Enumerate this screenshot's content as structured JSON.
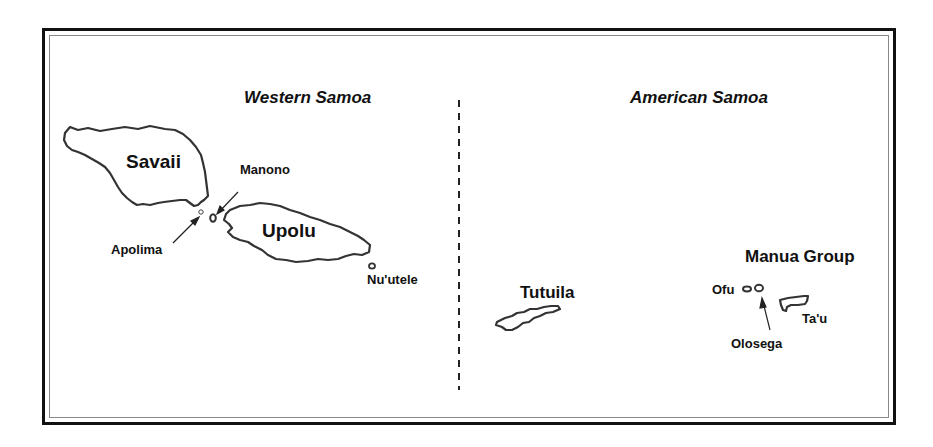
{
  "regions": {
    "western": "Western Samoa",
    "american": "American Samoa"
  },
  "islands": {
    "savaii": "Savaii",
    "upolu": "Upolu",
    "manono": "Manono",
    "apolima": "Apolima",
    "nuutele": "Nu'utele",
    "tutuila": "Tutuila",
    "ofu": "Ofu",
    "olosega": "Olosega",
    "tau": "Ta'u"
  },
  "groups": {
    "manua": "Manua Group"
  },
  "colors": {
    "outline": "#333333",
    "frame": "#111111",
    "text": "#111111"
  }
}
